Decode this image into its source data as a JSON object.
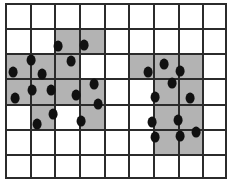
{
  "figure": {
    "title": "",
    "type": "grid-scatter-diagram"
  },
  "grid": {
    "columns": 9,
    "rows": 7,
    "cell_width": 24.67,
    "cell_height": 25.14,
    "line_color": "#2b2b2b",
    "line_width": 2,
    "shaded_color": "#b3b3b3",
    "empty_color": "#ffffff",
    "shaded_cells": [
      [
        1,
        2
      ],
      [
        1,
        3
      ],
      [
        2,
        0
      ],
      [
        2,
        1
      ],
      [
        2,
        2
      ],
      [
        2,
        5
      ],
      [
        2,
        6
      ],
      [
        2,
        7
      ],
      [
        3,
        0
      ],
      [
        3,
        1
      ],
      [
        3,
        2
      ],
      [
        3,
        3
      ],
      [
        3,
        6
      ],
      [
        3,
        7
      ],
      [
        4,
        1
      ],
      [
        4,
        3
      ],
      [
        4,
        6
      ],
      [
        4,
        7
      ],
      [
        5,
        6
      ],
      [
        5,
        7
      ]
    ]
  },
  "dots": {
    "color": "#111111",
    "radius_x": 4.4,
    "radius_y": 5.4,
    "count": 25,
    "points": [
      [
        58,
        46
      ],
      [
        84,
        45
      ],
      [
        31,
        60
      ],
      [
        71,
        61
      ],
      [
        13,
        72
      ],
      [
        42,
        74
      ],
      [
        148,
        72
      ],
      [
        164,
        64
      ],
      [
        180,
        71
      ],
      [
        32,
        90
      ],
      [
        51,
        90
      ],
      [
        76,
        95
      ],
      [
        94,
        84
      ],
      [
        15,
        98
      ],
      [
        98,
        104
      ],
      [
        155,
        97
      ],
      [
        190,
        98
      ],
      [
        172,
        83
      ],
      [
        53,
        114
      ],
      [
        81,
        121
      ],
      [
        37,
        124
      ],
      [
        152,
        122
      ],
      [
        178,
        120
      ],
      [
        155,
        137
      ],
      [
        180,
        136
      ],
      [
        196,
        132
      ]
    ]
  }
}
